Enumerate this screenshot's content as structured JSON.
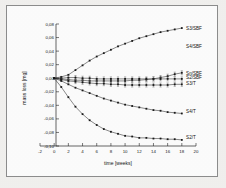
{
  "chart_data": {
    "type": "line",
    "title": "",
    "xlabel": "time [weeks]",
    "ylabel": "mass loss [mg]",
    "xlim": [
      -2,
      20
    ],
    "ylim": [
      -0.1,
      0.08
    ],
    "xticks": [
      -2,
      0,
      2,
      4,
      6,
      8,
      10,
      12,
      14,
      16,
      18,
      20
    ],
    "xticklabels": [
      "-2",
      "0",
      "2",
      "4",
      "6",
      "8",
      "10",
      "12",
      "14",
      "16",
      "18",
      "20"
    ],
    "yticks": [
      0.08,
      0.06,
      0.04,
      0.02,
      0.0,
      -0.02,
      -0.04,
      -0.06,
      -0.08,
      -0.1
    ],
    "yticklabels": [
      "0,08",
      "0,06",
      "0,04",
      "0,02",
      "0,00",
      "-0,02",
      "-0,04",
      "-0,06",
      "-0,08",
      "-0,10"
    ],
    "grid": false,
    "legend_position": "right-inline",
    "marker": "filled-square",
    "series": [
      {
        "name": "S3/SBF",
        "label": "S3/SBF",
        "label_x": 18.6,
        "label_y": 0.0735,
        "x": [
          0,
          1,
          2,
          3,
          4,
          5,
          6,
          7,
          8,
          9,
          10,
          11,
          12,
          13,
          14,
          15,
          16,
          17,
          18
        ],
        "values": [
          0.0,
          0.002,
          0.005,
          0.012,
          0.019,
          0.026,
          0.032,
          0.037,
          0.042,
          0.047,
          0.051,
          0.055,
          0.059,
          0.062,
          0.065,
          0.068,
          0.07,
          0.072,
          0.074
        ],
        "errors": [
          0,
          0,
          0,
          0,
          0,
          0,
          0,
          0,
          0,
          0,
          0,
          0,
          0,
          0,
          0,
          0,
          0,
          0,
          0
        ]
      },
      {
        "name": "S4/SBF",
        "label": "S4/SBF",
        "label_x": 18.6,
        "label_y": 0.0475,
        "x": [],
        "values": [],
        "errors": []
      },
      {
        "name": "Sn/SBF",
        "label": "Sn/SBF",
        "label_x": 18.6,
        "label_y": 0.0075,
        "x": [
          0,
          1,
          2,
          3,
          4,
          5,
          6,
          7,
          8,
          9,
          10,
          11,
          12,
          13,
          14,
          15,
          16,
          17,
          18
        ],
        "values": [
          0.0,
          -0.001,
          -0.002,
          -0.003,
          -0.003,
          -0.004,
          -0.004,
          -0.004,
          -0.004,
          -0.004,
          -0.004,
          -0.003,
          -0.003,
          -0.002,
          -0.001,
          0.001,
          0.003,
          0.006,
          0.008
        ],
        "errors": [
          0.0,
          0.002,
          0.003,
          0.003,
          0.003,
          0.003,
          0.003,
          0.003,
          0.003,
          0.003,
          0.003,
          0.003,
          0.003,
          0.003,
          0.003,
          0.003,
          0.003,
          0.003,
          0.003
        ]
      },
      {
        "name": "S2/SBF",
        "label": "S2/SBF",
        "label_x": 18.6,
        "label_y": 0.0005,
        "x": [
          0,
          1,
          2,
          3,
          4,
          5,
          6,
          7,
          8,
          9,
          10,
          11,
          12,
          13,
          14,
          15,
          16,
          17,
          18
        ],
        "values": [
          0.0,
          0.0,
          0.001,
          0.001,
          0.0,
          0.0,
          -0.001,
          -0.001,
          -0.001,
          -0.001,
          -0.001,
          -0.001,
          -0.001,
          -0.001,
          -0.001,
          -0.001,
          -0.001,
          -0.001,
          -0.001
        ],
        "errors": [
          0.0,
          0.002,
          0.003,
          0.003,
          0.003,
          0.003,
          0.003,
          0.003,
          0.003,
          0.003,
          0.003,
          0.003,
          0.003,
          0.003,
          0.003,
          0.003,
          0.003,
          0.003,
          0.003
        ]
      },
      {
        "name": "S3/T",
        "label": "S3/T",
        "label_x": 18.6,
        "label_y": -0.0075,
        "x": [
          0,
          1,
          2,
          3,
          4,
          5,
          6,
          7,
          8,
          9,
          10,
          11,
          12,
          13,
          14,
          15,
          16,
          17,
          18
        ],
        "values": [
          0.0,
          -0.002,
          -0.004,
          -0.005,
          -0.006,
          -0.007,
          -0.008,
          -0.008,
          -0.009,
          -0.009,
          -0.01,
          -0.01,
          -0.01,
          -0.01,
          -0.01,
          -0.01,
          -0.01,
          -0.009,
          -0.009
        ],
        "errors": [
          0.0,
          0.002,
          0.003,
          0.003,
          0.003,
          0.003,
          0.003,
          0.003,
          0.003,
          0.003,
          0.003,
          0.003,
          0.003,
          0.003,
          0.003,
          0.003,
          0.003,
          0.003,
          0.003
        ]
      },
      {
        "name": "S4/T",
        "label": "S4/T",
        "label_x": 18.6,
        "label_y": -0.0485,
        "x": [
          0,
          1,
          2,
          3,
          4,
          5,
          6,
          7,
          8,
          9,
          10,
          11,
          12,
          13,
          14,
          15,
          16,
          17,
          18
        ],
        "values": [
          0.0,
          -0.004,
          -0.009,
          -0.014,
          -0.018,
          -0.022,
          -0.026,
          -0.03,
          -0.033,
          -0.036,
          -0.039,
          -0.041,
          -0.043,
          -0.045,
          -0.047,
          -0.048,
          -0.05,
          -0.051,
          -0.052
        ],
        "errors": [
          0,
          0,
          0,
          0,
          0,
          0,
          0,
          0,
          0,
          0,
          0,
          0,
          0,
          0,
          0,
          0,
          0,
          0,
          0
        ]
      },
      {
        "name": "S2/T",
        "label": "S2/T",
        "label_x": 18.6,
        "label_y": -0.0875,
        "x": [
          0,
          1,
          2,
          3,
          4,
          5,
          6,
          7,
          8,
          9,
          10,
          11,
          12,
          13,
          14,
          15,
          16,
          17,
          18
        ],
        "values": [
          0.0,
          -0.013,
          -0.028,
          -0.042,
          -0.053,
          -0.062,
          -0.069,
          -0.075,
          -0.079,
          -0.082,
          -0.085,
          -0.086,
          -0.088,
          -0.088,
          -0.089,
          -0.089,
          -0.09,
          -0.09,
          -0.091
        ],
        "errors": [
          0,
          0,
          0,
          0,
          0,
          0,
          0,
          0,
          0,
          0,
          0,
          0,
          0,
          0,
          0,
          0,
          0,
          0,
          0
        ]
      }
    ]
  }
}
